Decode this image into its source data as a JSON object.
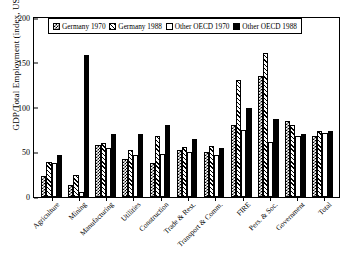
{
  "chart_data": {
    "type": "bar",
    "title": "",
    "xlabel": "",
    "ylabel": "GDP/Total Employment (index, US = 100)",
    "ylim": [
      0,
      200
    ],
    "yticks": [
      0,
      50,
      100,
      150,
      200
    ],
    "grid": false,
    "legend_position": "top-inside",
    "categories": [
      "Agriculture",
      "Mining",
      "Manufacturing",
      "Utilities",
      "Construction",
      "Trade & Rest.",
      "Transport & Comm.",
      "FIRE",
      "Pers. & Soc.",
      "Government",
      "Total"
    ],
    "series": [
      {
        "name": "Germany 1970",
        "pattern": "checker",
        "values": [
          24,
          13,
          58,
          42,
          38,
          52,
          50,
          80,
          135,
          85,
          68
        ]
      },
      {
        "name": "Germany 1988",
        "pattern": "hatch",
        "values": [
          39,
          25,
          60,
          53,
          68,
          56,
          57,
          131,
          161,
          80,
          74
        ]
      },
      {
        "name": "Other OECD 1970",
        "pattern": "white",
        "values": [
          38,
          6,
          55,
          47,
          48,
          50,
          47,
          75,
          62,
          68,
          72
        ]
      },
      {
        "name": "Other OECD 1988",
        "pattern": "solid-black",
        "values": [
          47,
          159,
          70,
          70,
          80,
          65,
          55,
          100,
          87,
          70,
          74
        ]
      }
    ]
  },
  "legend": {
    "items": [
      {
        "label": "Germany 1970"
      },
      {
        "label": "Germany 1988"
      },
      {
        "label": "Other OECD 1970"
      },
      {
        "label": "Other OECD 1988"
      }
    ]
  },
  "colors": {
    "axis": "#000000",
    "background": "#ffffff",
    "bar_outline": "#000000",
    "solid_series": "#000000"
  }
}
